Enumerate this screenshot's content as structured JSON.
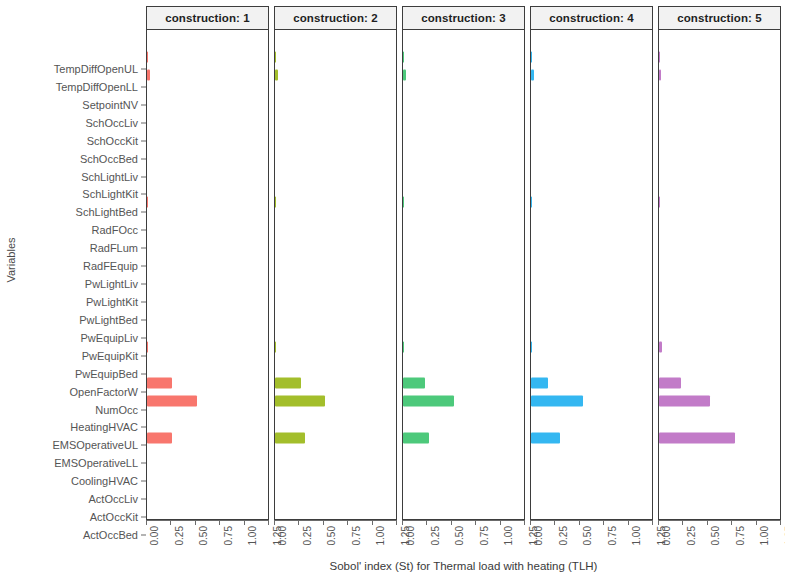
{
  "axes": {
    "y_title": "Variables",
    "x_title": "Sobol' index (St) for Thermal load with heating (TLH)",
    "x_ticks": [
      "0.00",
      "0.25",
      "0.50",
      "0.75",
      "1.00",
      "1.25"
    ]
  },
  "chart_data": {
    "type": "bar",
    "title": "",
    "subtitle": "",
    "xlabel": "Sobol' index (St) for Thermal load with heating (TLH)",
    "ylabel": "Variables",
    "xlim": [
      0,
      1.25
    ],
    "grid": false,
    "legend": "none",
    "orientation": "horizontal",
    "facet_variable": "construction",
    "facet_labels": [
      "construction: 1",
      "construction: 2",
      "construction: 3",
      "construction: 4",
      "construction: 5"
    ],
    "categories": [
      "TempDiffOpenUL",
      "TempDiffOpenLL",
      "SetpointNV",
      "SchOccLiv",
      "SchOccKit",
      "SchOccBed",
      "SchLightLiv",
      "SchLightKit",
      "SchLightBed",
      "RadFOcc",
      "RadFLum",
      "RadFEquip",
      "PwLightLiv",
      "PwLightKit",
      "PwLightBed",
      "PwEquipLiv",
      "PwEquipKit",
      "PwEquipBed",
      "OpenFactorW",
      "NumOcc",
      "HeatingHVAC",
      "EMSOperativeUL",
      "EMSOperativeLL",
      "CoolingHVAC",
      "ActOccLiv",
      "ActOccKit",
      "ActOccBed"
    ],
    "series": [
      {
        "name": "construction: 1",
        "color": "#F8766D",
        "values": [
          0.0,
          0.004,
          0.026,
          0.0,
          0.0,
          0.0,
          0.0,
          0.0,
          0.0,
          0.003,
          0.0,
          0.0,
          0.0,
          0.0,
          0.0,
          0.0,
          0.0,
          0.004,
          0.0,
          0.26,
          0.52,
          0.0,
          0.26,
          0.0,
          0.0,
          0.0,
          0.0
        ]
      },
      {
        "name": "construction: 2",
        "color": "#A3BE2B",
        "values": [
          0.0,
          0.006,
          0.03,
          0.0,
          0.0,
          0.0,
          0.0,
          0.0,
          0.0,
          0.003,
          0.0,
          0.0,
          0.0,
          0.0,
          0.0,
          0.0,
          0.0,
          0.006,
          0.0,
          0.27,
          0.52,
          0.0,
          0.31,
          0.0,
          0.0,
          0.0,
          0.0
        ]
      },
      {
        "name": "construction: 3",
        "color": "#4DC97B",
        "values": [
          0.0,
          0.004,
          0.032,
          0.0,
          0.0,
          0.0,
          0.0,
          0.0,
          0.0,
          0.003,
          0.0,
          0.0,
          0.0,
          0.0,
          0.0,
          0.0,
          0.0,
          0.003,
          0.0,
          0.23,
          0.53,
          0.0,
          0.27,
          0.0,
          0.0,
          0.0,
          0.0
        ]
      },
      {
        "name": "construction: 4",
        "color": "#34B7F1",
        "values": [
          0.0,
          0.004,
          0.03,
          0.0,
          0.0,
          0.0,
          0.0,
          0.0,
          0.0,
          0.003,
          0.0,
          0.0,
          0.0,
          0.0,
          0.0,
          0.0,
          0.0,
          0.003,
          0.0,
          0.18,
          0.54,
          0.0,
          0.3,
          0.0,
          0.0,
          0.0,
          0.0
        ]
      },
      {
        "name": "construction: 5",
        "color": "#C27BC8",
        "values": [
          0.0,
          0.003,
          0.018,
          0.0,
          0.0,
          0.0,
          0.0,
          0.0,
          0.0,
          0.002,
          0.0,
          0.0,
          0.0,
          0.0,
          0.0,
          0.0,
          0.0,
          0.03,
          0.0,
          0.23,
          0.53,
          0.0,
          0.78,
          0.0,
          0.0,
          0.0,
          0.0
        ]
      }
    ]
  }
}
